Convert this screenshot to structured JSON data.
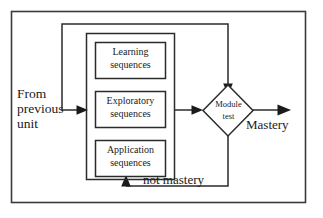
{
  "diagram": {
    "entry": {
      "label_lines": [
        "From",
        "previous",
        "unit"
      ],
      "label_full": "From previous unit"
    },
    "container": {
      "name": "instructional-sequences-group"
    },
    "nodes": [
      {
        "id": "learning",
        "lines": [
          "Learning",
          "sequences"
        ],
        "label_full": "Learning sequences"
      },
      {
        "id": "exploratory",
        "lines": [
          "Exploratory",
          "sequences"
        ],
        "label_full": "Exploratory sequences"
      },
      {
        "id": "application",
        "lines": [
          "Application",
          "sequences"
        ],
        "label_full": "Application sequences"
      }
    ],
    "decision": {
      "id": "module-test",
      "lines": [
        "Module",
        "test"
      ],
      "label_full": "Module test"
    },
    "edges": [
      {
        "id": "mastery",
        "label": "Mastery",
        "from": "module-test",
        "direction": "right"
      },
      {
        "id": "not-mastery",
        "label": "not mastery",
        "from": "module-test",
        "direction": "loop-back"
      }
    ],
    "colors": {
      "stroke": "#2b2b2b",
      "frame": "#3b3b3b",
      "fill": "#ffffff",
      "text": "#1a1a1a"
    }
  }
}
